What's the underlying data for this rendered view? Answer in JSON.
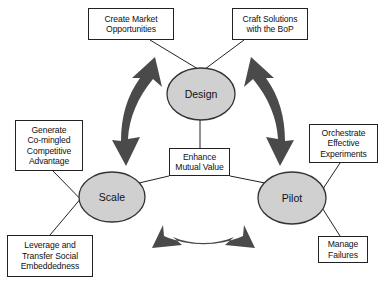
{
  "diagram": {
    "colors": {
      "node_fill": "#d0d0d0",
      "node_stroke": "#333333",
      "arrow_fill": "#4a4a4a",
      "line_stroke": "#222222",
      "box_fill": "#ffffff",
      "box_stroke": "#222222",
      "background": "#ffffff"
    },
    "nodes": [
      {
        "id": "design",
        "label": "Design",
        "cx": 201,
        "cy": 94,
        "rx": 34,
        "ry": 26
      },
      {
        "id": "scale",
        "label": "Scale",
        "cx": 112,
        "cy": 197,
        "rx": 33,
        "ry": 25
      },
      {
        "id": "pilot",
        "label": "Pilot",
        "cx": 292,
        "cy": 198,
        "rx": 34,
        "ry": 26
      }
    ],
    "center_box": {
      "id": "enhance-mutual-value",
      "label": "Enhance\nMutual Value",
      "x": 169,
      "y": 148,
      "w": 61,
      "h": 28
    },
    "callouts": [
      {
        "id": "create-market-opportunities",
        "label": "Create Market\nOpportunities",
        "x": 88,
        "y": 8,
        "w": 86,
        "h": 32,
        "attached_to": "design"
      },
      {
        "id": "craft-solutions-with-the-bop",
        "label": "Craft Solutions\nwith the BoP",
        "x": 232,
        "y": 8,
        "w": 76,
        "h": 32,
        "attached_to": "design"
      },
      {
        "id": "generate-co-mingled-competitive-advantage",
        "label": "Generate\nCo-mingled\nCompetitive\nAdvantage",
        "x": 15,
        "y": 120,
        "w": 68,
        "h": 51,
        "attached_to": "scale"
      },
      {
        "id": "leverage-and-transfer-social-embeddedness",
        "label": "Leverage and\nTransfer Social\nEmbeddedness",
        "x": 7,
        "y": 235,
        "w": 86,
        "h": 42,
        "attached_to": "scale"
      },
      {
        "id": "orchestrate-effective-experiments",
        "label": "Orchestrate\nEffective\nExperiments",
        "x": 309,
        "y": 124,
        "w": 69,
        "h": 39,
        "attached_to": "pilot"
      },
      {
        "id": "manage-failures",
        "label": "Manage\nFailures",
        "x": 318,
        "y": 236,
        "w": 50,
        "h": 27,
        "attached_to": "pilot"
      }
    ],
    "arrows": [
      {
        "id": "arrow-scale-design",
        "between": [
          "scale",
          "design"
        ],
        "double_headed": true
      },
      {
        "id": "arrow-design-pilot",
        "between": [
          "design",
          "pilot"
        ],
        "double_headed": true
      },
      {
        "id": "arrow-scale-pilot",
        "between": [
          "scale",
          "pilot"
        ],
        "double_headed": true
      }
    ]
  }
}
